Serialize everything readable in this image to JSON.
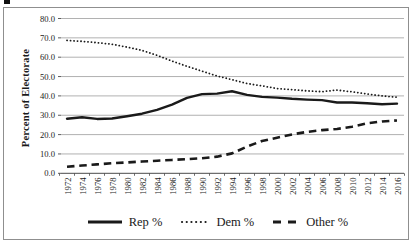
{
  "chart_data": {
    "type": "line",
    "title": "",
    "xlabel": "",
    "ylabel": "Percent of Electorate",
    "ylim": [
      0,
      80
    ],
    "y_ticks": [
      "0.0",
      "10.0",
      "20.0",
      "30.0",
      "40.0",
      "50.0",
      "60.0",
      "70.0",
      "80.0"
    ],
    "grid": true,
    "legend_position": "bottom",
    "categories": [
      "1972",
      "1974",
      "1976",
      "1978",
      "1980",
      "1982",
      "1984",
      "1986",
      "1988",
      "1990",
      "1992",
      "1994",
      "1996",
      "1998",
      "2000",
      "2002",
      "2004",
      "2006",
      "2008",
      "2010",
      "2012",
      "2014",
      "2016"
    ],
    "series": [
      {
        "name": "Rep %",
        "style": "solid",
        "values": [
          28.2,
          29.0,
          28.1,
          28.3,
          29.5,
          30.8,
          32.8,
          35.5,
          39.0,
          40.9,
          41.2,
          42.4,
          40.5,
          39.5,
          39.1,
          38.5,
          38.1,
          37.8,
          36.6,
          36.6,
          36.2,
          35.7,
          36.0
        ]
      },
      {
        "name": "Dem %",
        "style": "dotted",
        "values": [
          68.7,
          68.2,
          67.5,
          66.7,
          65.2,
          63.5,
          61.0,
          58.0,
          55.3,
          52.8,
          50.3,
          48.4,
          46.4,
          45.2,
          43.8,
          43.2,
          42.6,
          42.2,
          43.0,
          42.1,
          41.0,
          40.0,
          39.3
        ]
      },
      {
        "name": "Other %",
        "style": "dashed",
        "values": [
          3.4,
          4.0,
          4.6,
          5.2,
          5.6,
          6.1,
          6.5,
          6.9,
          7.3,
          7.8,
          8.6,
          10.3,
          13.8,
          16.7,
          18.4,
          20.1,
          21.4,
          22.3,
          22.9,
          24.1,
          25.8,
          26.8,
          27.3
        ]
      }
    ],
    "colors": {
      "line": "#1a1a1a",
      "grid": "#a8a8a8",
      "axis": "#4a4a4a",
      "border": "#8f8f8f",
      "text": "#1a1a1a"
    }
  }
}
